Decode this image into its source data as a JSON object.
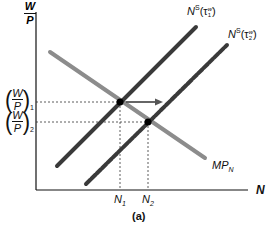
{
  "diagram": {
    "caption": "(a)",
    "axes": {
      "y_label_num": "W",
      "y_label_den": "P",
      "x_label": "N"
    },
    "y_ticks": [
      {
        "num": "W",
        "den": "P",
        "sub": "1"
      },
      {
        "num": "W",
        "den": "P",
        "sub": "2"
      }
    ],
    "x_ticks": [
      {
        "base": "N",
        "sub": "1"
      },
      {
        "base": "N",
        "sub": "2"
      }
    ],
    "curves": {
      "labor_supply_1": {
        "base": "N",
        "sup": "S",
        "arg": "(τ",
        "arg_sup": "w",
        "arg_sub": "1",
        "close": ")",
        "color": "#3a3a3a",
        "style": "solid"
      },
      "labor_supply_2": {
        "base": "N",
        "sup": "S",
        "arg": "(τ",
        "arg_sup": "w",
        "arg_sub": "2",
        "close": ")",
        "color": "#3a3a3a",
        "style": "dashed"
      },
      "labor_demand": {
        "base": "MP",
        "sub": "N",
        "color": "#8c8c8c",
        "style": "solid"
      }
    },
    "colors": {
      "axis": "#111111",
      "supply": "#3a3a3a",
      "demand": "#8c8c8c",
      "arrow": "#555555",
      "guides": "#333333"
    }
  }
}
